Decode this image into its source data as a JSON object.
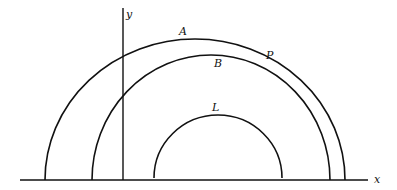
{
  "diagram": {
    "axes": {
      "x_label": "x",
      "y_label": "y"
    },
    "curves": [
      {
        "id": "A",
        "label": "A",
        "description": "outer semicircular arc"
      },
      {
        "id": "B",
        "label": "B",
        "description": "middle semicircular arc intersecting A at P"
      },
      {
        "id": "L",
        "label": "L",
        "description": "inner small semicircular arc"
      }
    ],
    "points": [
      {
        "id": "P",
        "label": "P",
        "description": "intersection of arcs A and B"
      }
    ],
    "colors": {
      "stroke": "#111111",
      "background": "#ffffff"
    }
  }
}
